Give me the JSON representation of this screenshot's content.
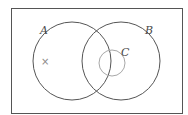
{
  "diagram": {
    "type": "venn",
    "universe": {
      "x": 11,
      "y": 8,
      "width": 171,
      "height": 105,
      "stroke": "#555555"
    },
    "sets": [
      {
        "name": "A",
        "label": "A",
        "cx": 72,
        "cy": 61,
        "r": 39,
        "stroke": "#555555",
        "label_x": 40,
        "label_y": 34
      },
      {
        "name": "B",
        "label": "B",
        "cx": 121,
        "cy": 61,
        "r": 39,
        "stroke": "#555555",
        "label_x": 145,
        "label_y": 34
      },
      {
        "name": "C",
        "label": "C",
        "cx": 112,
        "cy": 63,
        "r": 13,
        "stroke": "#a8a8a8",
        "label_x": 121,
        "label_y": 56
      }
    ],
    "markers": [
      {
        "symbol": "×",
        "x": 41,
        "y": 65,
        "region": "A only"
      }
    ]
  }
}
